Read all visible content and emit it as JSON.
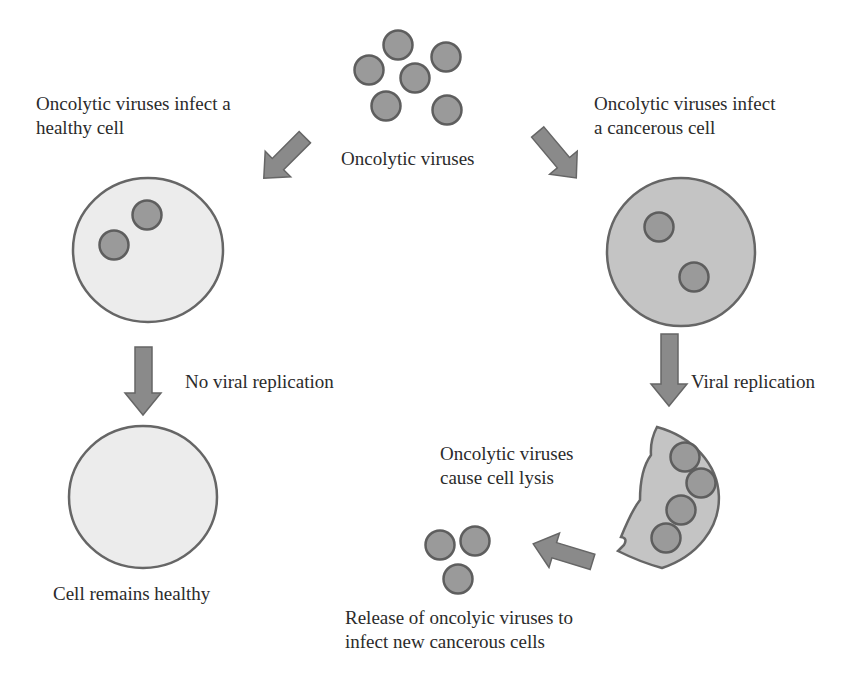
{
  "colors": {
    "virus_fill": "#9a9a9a",
    "virus_stroke": "#5e5e5e",
    "healthy_cell_fill": "#ececec",
    "cancer_cell_fill": "#c4c4c4",
    "cell_stroke": "#666666",
    "arrow_fill": "#8a8a8a",
    "arrow_stroke": "#666666",
    "text": "#2b2b2b"
  },
  "labels": {
    "oncolytic_viruses": "Oncolytic viruses",
    "healthy_infect_line1": "Oncolytic viruses infect a",
    "healthy_infect_line2": "healthy cell",
    "cancer_infect_line1": "Oncolytic viruses infect",
    "cancer_infect_line2": "a cancerous cell",
    "no_replication": "No viral replication",
    "replication": "Viral replication",
    "cell_healthy": "Cell remains healthy",
    "lysis_line1": "Oncolytic viruses",
    "lysis_line2": "cause cell lysis",
    "release_line1": "Release of oncolyic viruses to",
    "release_line2": "infect new cancerous cells"
  },
  "nodes": [
    {
      "id": "virus-cluster",
      "type": "virus-group",
      "count": 6
    },
    {
      "id": "healthy-cell-infected",
      "type": "healthy-cell",
      "virus_count": 2
    },
    {
      "id": "cancer-cell-infected",
      "type": "cancer-cell",
      "virus_count": 2
    },
    {
      "id": "healthy-cell-final",
      "type": "healthy-cell",
      "virus_count": 0
    },
    {
      "id": "lysed-cancer-cell",
      "type": "lysed-cell",
      "virus_count": 4
    },
    {
      "id": "released-viruses",
      "type": "virus-group",
      "count": 3
    }
  ],
  "edges": [
    {
      "from": "virus-cluster",
      "to": "healthy-cell-infected",
      "label": "Oncolytic viruses infect a healthy cell"
    },
    {
      "from": "virus-cluster",
      "to": "cancer-cell-infected",
      "label": "Oncolytic viruses infect a cancerous cell"
    },
    {
      "from": "healthy-cell-infected",
      "to": "healthy-cell-final",
      "label": "No viral replication"
    },
    {
      "from": "cancer-cell-infected",
      "to": "lysed-cancer-cell",
      "label": "Viral replication"
    },
    {
      "from": "lysed-cancer-cell",
      "to": "released-viruses",
      "label": "Oncolytic viruses cause cell lysis"
    }
  ]
}
